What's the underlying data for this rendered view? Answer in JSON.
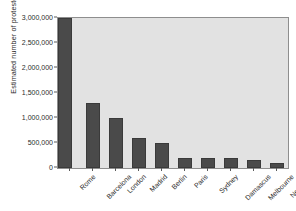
{
  "chart_data": {
    "type": "bar",
    "title": "",
    "xlabel": "",
    "ylabel": "Estimated number of protestors",
    "categories": [
      "Rome",
      "Barcelona",
      "London",
      "Madrid",
      "Berlin",
      "Paris",
      "Sydney",
      "Damascus",
      "Melbourne",
      "New York"
    ],
    "values": [
      3000000,
      1300000,
      1000000,
      600000,
      500000,
      200000,
      200000,
      200000,
      170000,
      110000
    ],
    "ylim": [
      0,
      3000000
    ],
    "ytick_values": [
      0,
      500000,
      1000000,
      1500000,
      2000000,
      2500000,
      3000000
    ],
    "ytick_labels": [
      "0",
      "500,000",
      "1,000,000",
      "1,500,000",
      "2,000,000",
      "2,500,000",
      "3,000,000"
    ],
    "grid": false,
    "legend": "none",
    "colors": {
      "bar_fill": "#4a4a4a",
      "bar_edge": "#3a3a3a",
      "plot_background": "#e2e2e2",
      "plot_border": "#8e8e8e",
      "figure_background": "#ffffff",
      "text": "#2b2b2b"
    }
  }
}
